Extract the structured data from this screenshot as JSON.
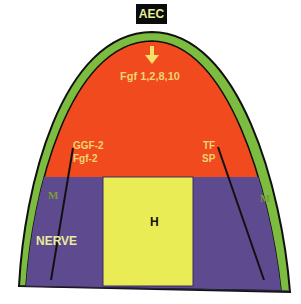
{
  "title_box": {
    "label": "AEC"
  },
  "regions": {
    "ectoderm_label": "AEC",
    "mesenchyme_signal": "Fgf 1,2,8,10",
    "left_factor_1": "GGF-2",
    "left_factor_2": "Fgf-2",
    "right_factor_1": "TF",
    "right_factor_2": "SP",
    "left_muscle": "M",
    "right_muscle": "M",
    "nerve": "NERVE",
    "center": "H"
  },
  "colors": {
    "background": "#ffffff",
    "outline": "#111111",
    "aec_band": "#7cbd3f",
    "mesenchyme": "#f04a1e",
    "muscle_band": "#5e4a8e",
    "center_block": "#eaec55",
    "label_text": "#f2d470",
    "muscle_label": "#7a9a3a",
    "aec_box": "#0b0b0b",
    "aec_text": "#e6ee9c",
    "arrow": "#f5e06a"
  },
  "icons": {
    "signal_arrow": "down-arrow-icon"
  }
}
